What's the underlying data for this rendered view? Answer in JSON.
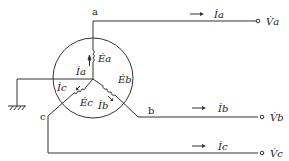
{
  "diagram": {
    "nodes": {
      "a": "a",
      "b": "b",
      "c": "c"
    },
    "emfs": {
      "a": "Ėa",
      "b": "Ėb",
      "c": "Ėc"
    },
    "currents_inner": {
      "a": "İa",
      "b": "İb",
      "c": "İc"
    },
    "currents_line": {
      "a": "İa",
      "b": "İb",
      "c": "İc"
    },
    "voltages": {
      "a": "V̇a",
      "b": "V̇b",
      "c": "V̇c"
    }
  }
}
